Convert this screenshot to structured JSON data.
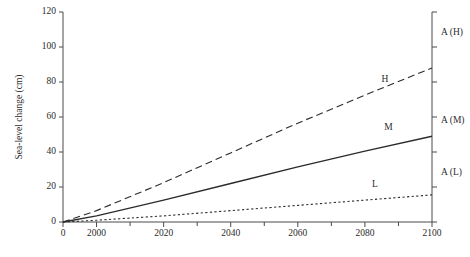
{
  "chart_data": {
    "type": "line",
    "title": "",
    "xlabel": "",
    "ylabel": "Sea-level change (cm)",
    "xlim": [
      1990,
      2100
    ],
    "ylim": [
      0,
      120
    ],
    "grid": false,
    "legend_position": "inline-right",
    "x_ticks": [
      "2000",
      "2020",
      "2040",
      "2060",
      "2080",
      "2100"
    ],
    "x_tick_values": [
      2000,
      2020,
      2040,
      2060,
      2080,
      2100
    ],
    "x_minor_tick_values": [
      2010,
      2030,
      2050,
      2070,
      2090
    ],
    "origin_label": "0",
    "y_ticks": [
      "0",
      "20",
      "40",
      "60",
      "80",
      "100",
      "120"
    ],
    "y_tick_values": [
      0,
      20,
      40,
      60,
      80,
      100,
      120
    ],
    "x": [
      1990,
      2000,
      2020,
      2040,
      2060,
      2080,
      2100
    ],
    "series": [
      {
        "name": "H",
        "label": "H",
        "style": "dashed",
        "values": [
          0,
          6.5,
          22.5,
          39.5,
          56.5,
          72.5,
          88.0
        ],
        "label_x": 2086,
        "label_y": 81
      },
      {
        "name": "M",
        "label": "M",
        "style": "solid",
        "values": [
          0,
          3.5,
          12.5,
          22.0,
          31.5,
          40.5,
          49.0
        ],
        "label_x": 2087,
        "label_y": 54
      },
      {
        "name": "L",
        "label": "L",
        "style": "dotted",
        "values": [
          0,
          1.0,
          3.5,
          6.5,
          9.5,
          12.5,
          15.5
        ],
        "label_x": 2083,
        "label_y": 21
      }
    ],
    "right_axis": {
      "ticks": [
        0,
        20,
        40,
        60,
        80,
        100,
        120
      ],
      "annotations": [
        {
          "label": "A (H)",
          "value": 108
        },
        {
          "label": "A (M)",
          "value": 58
        },
        {
          "label": "A (L)",
          "value": 28
        }
      ]
    }
  }
}
